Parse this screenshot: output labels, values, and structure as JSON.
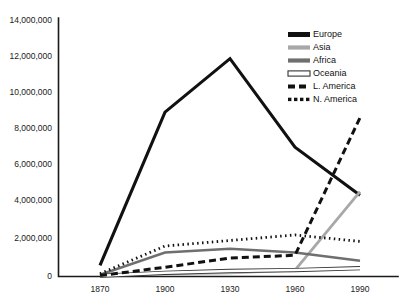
{
  "chart_data": {
    "type": "line",
    "title": "",
    "subtitle": "",
    "xlabel": "",
    "ylabel": "",
    "x": [
      1870,
      1900,
      1930,
      1960,
      1990
    ],
    "categories": [
      "1870",
      "1900",
      "1930",
      "1960",
      "1990"
    ],
    "xlim": [
      1870,
      1990
    ],
    "ylim": [
      0,
      14000000
    ],
    "grid": false,
    "legend_position": "top-right",
    "y_ticks": [
      0,
      2000000,
      4000000,
      6000000,
      8000000,
      10000000,
      12000000,
      14000000
    ],
    "y_tick_labels": [
      "0",
      "2,000,000",
      "4,000,000",
      "6,000,000",
      "8,000,000",
      "10,000,000",
      "12,000,000",
      "14,000,000"
    ],
    "x_ticks": [
      1870,
      1900,
      1930,
      1960,
      1990
    ],
    "x_tick_labels": [
      "1870",
      "1900",
      "1930",
      "1960",
      "1990"
    ],
    "series": [
      {
        "name": "Europe",
        "values": [
          600000,
          8900000,
          11800000,
          7000000,
          4400000
        ],
        "color": "#111111",
        "width": 3.1,
        "dash": "none",
        "swatch": "solid-thick-black"
      },
      {
        "name": "Asia",
        "values": [
          60000,
          150000,
          200000,
          350000,
          4600000
        ],
        "color": "#a8a8a8",
        "width": 2.8,
        "dash": "none",
        "swatch": "solid-light-gray"
      },
      {
        "name": "Africa",
        "values": [
          100000,
          1300000,
          1500000,
          1300000,
          850000
        ],
        "color": "#6f6f6f",
        "width": 2.6,
        "dash": "none",
        "swatch": "solid-mid-gray"
      },
      {
        "name": "Oceania",
        "values": [
          40000,
          200000,
          300000,
          350000,
          450000
        ],
        "color": "#ffffff",
        "width": 2.6,
        "dash": "none",
        "swatch": "outline-white"
      },
      {
        "name": "L. America",
        "values": [
          50000,
          500000,
          1000000,
          1150000,
          8600000
        ],
        "color": "#111111",
        "width": 3.0,
        "dash": "7,4",
        "swatch": "dashed-black"
      },
      {
        "name": "N. America",
        "values": [
          150000,
          1650000,
          1950000,
          2250000,
          1900000
        ],
        "color": "#111111",
        "width": 2.8,
        "dash": "1.5,3.4",
        "swatch": "dotted-black"
      }
    ]
  },
  "legend": {
    "items": [
      {
        "label": "Europe"
      },
      {
        "label": "Asia"
      },
      {
        "label": "Africa"
      },
      {
        "label": "Oceania"
      },
      {
        "label": "L. America"
      },
      {
        "label": "N. America"
      }
    ]
  }
}
